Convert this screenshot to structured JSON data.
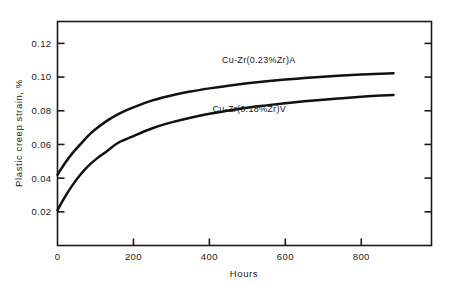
{
  "chart_data": {
    "type": "line",
    "title": "",
    "xlabel": "Hours",
    "ylabel": "Plastic creep strain, %",
    "xlim": [
      0,
      985
    ],
    "ylim": [
      0,
      0.133
    ],
    "grid": false,
    "legend_position": "inline-right-of-curve",
    "xticks": [
      0,
      200,
      400,
      600,
      800
    ],
    "xtick_labels": [
      "0",
      "200",
      "400",
      "600",
      "800"
    ],
    "yticks": [
      0.02,
      0.04,
      0.06,
      0.08,
      0.1,
      0.12
    ],
    "ytick_labels": [
      "0.02",
      "0.04",
      "0.06",
      "0.08",
      "0.10",
      "0.12"
    ],
    "series": [
      {
        "name": "Cu-Zr(0.23%Zr)A",
        "label": "Cu-Zr(0.23%Zr)A",
        "color": "#111111",
        "x": [
          0,
          20,
          40,
          60,
          80,
          100,
          130,
          160,
          200,
          250,
          300,
          350,
          400,
          450,
          500,
          550,
          600,
          650,
          700,
          750,
          800,
          850,
          885
        ],
        "y": [
          0.042,
          0.049,
          0.055,
          0.06,
          0.065,
          0.069,
          0.074,
          0.078,
          0.082,
          0.0862,
          0.0891,
          0.0914,
          0.0933,
          0.0949,
          0.0963,
          0.0975,
          0.0985,
          0.0994,
          0.1002,
          0.1009,
          0.1015,
          0.102,
          0.1023
        ]
      },
      {
        "name": "Cu-Zr(0.18%Zr)V",
        "label": "Cu-Zr(0.18%Zr)V",
        "color": "#111111",
        "x": [
          0,
          20,
          40,
          60,
          80,
          100,
          130,
          160,
          200,
          250,
          300,
          350,
          400,
          450,
          500,
          550,
          600,
          650,
          700,
          750,
          800,
          850,
          885
        ],
        "y": [
          0.021,
          0.029,
          0.036,
          0.042,
          0.047,
          0.051,
          0.056,
          0.061,
          0.065,
          0.0696,
          0.0731,
          0.0759,
          0.0782,
          0.0801,
          0.0818,
          0.0832,
          0.0845,
          0.0856,
          0.0866,
          0.0875,
          0.0883,
          0.089,
          0.0894
        ]
      }
    ],
    "series_label_positions": [
      {
        "x": 530,
        "y": 0.1085
      },
      {
        "x": 505,
        "y": 0.0795
      }
    ]
  },
  "axes": {
    "frame_color": "#1a1a1a",
    "ticks_inward": true,
    "right_axis_ticks": true,
    "top_axis_ticks": false
  }
}
